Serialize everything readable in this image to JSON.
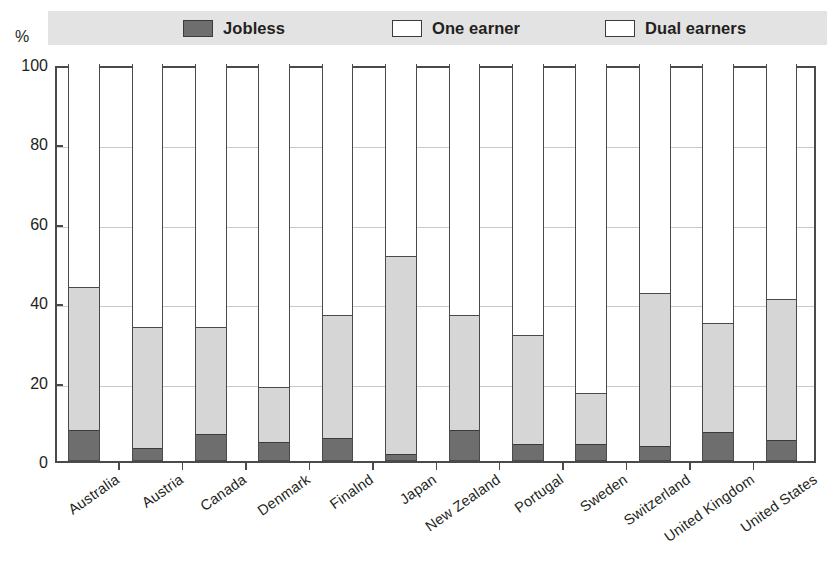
{
  "axis": {
    "percent_symbol": "%",
    "y_ticks": [
      0,
      20,
      40,
      60,
      80,
      100
    ],
    "y_min": 0,
    "y_max": 100
  },
  "legend": {
    "items": [
      {
        "label": "Jobless",
        "swatch_color": "#6e6e6e",
        "key": "jobless"
      },
      {
        "label": "One earner",
        "swatch_color": "#ffffff",
        "key": "one_earner"
      },
      {
        "label": "Dual earners",
        "swatch_color": "#ffffff",
        "key": "dual_earners"
      }
    ]
  },
  "chart_data": {
    "type": "bar",
    "stacked": true,
    "title": "",
    "xlabel": "",
    "ylabel": "%",
    "ylim": [
      0,
      100
    ],
    "grid": true,
    "legend_position": "top",
    "categories": [
      "Australia",
      "Austria",
      "Canada",
      "Denmark",
      "Finalnd",
      "Japan",
      "New Zealand",
      "Portugal",
      "Sweden",
      "Switzerland",
      "United Kingdom",
      "United States"
    ],
    "series": [
      {
        "name": "Jobless",
        "color": "#6e6e6e",
        "values": [
          7.5,
          3.0,
          6.5,
          4.5,
          5.5,
          1.5,
          7.5,
          4.0,
          4.0,
          3.5,
          7.0,
          5.0
        ]
      },
      {
        "name": "One earner",
        "color": "#d6d6d6",
        "values": [
          36.0,
          30.5,
          27.0,
          14.0,
          31.0,
          50.0,
          29.0,
          27.5,
          13.0,
          38.5,
          27.5,
          35.5
        ]
      },
      {
        "name": "Dual earners",
        "color": "#ffffff",
        "values": [
          56.5,
          66.5,
          66.5,
          81.5,
          63.5,
          48.5,
          63.5,
          68.5,
          83.0,
          58.0,
          65.5,
          59.5
        ]
      }
    ],
    "cumulative_tops": {
      "jobless": [
        7.5,
        3.0,
        6.5,
        4.5,
        5.5,
        1.5,
        7.5,
        4.0,
        4.0,
        3.5,
        7.0,
        5.0
      ],
      "one_earner": [
        43.5,
        33.5,
        33.5,
        18.5,
        36.5,
        51.5,
        36.5,
        31.5,
        17.0,
        42.0,
        34.5,
        40.5
      ],
      "total": [
        100,
        100,
        100,
        100,
        100,
        100,
        100,
        100,
        100,
        100,
        100,
        100
      ]
    }
  }
}
